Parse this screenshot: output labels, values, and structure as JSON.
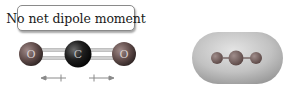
{
  "label": {
    "text": "No net dipole moment"
  },
  "molecule_left": {
    "name": "CO2 ball-and-stick",
    "atoms": [
      {
        "symbol": "O",
        "cx": 31,
        "cy": 54,
        "r": 12,
        "color": "#6e5a58"
      },
      {
        "symbol": "C",
        "cx": 78,
        "cy": 54,
        "r": 13,
        "color": "#1a1a1a"
      },
      {
        "symbol": "O",
        "cx": 124,
        "cy": 54,
        "r": 12,
        "color": "#6e5a58"
      }
    ],
    "bond_color": "#c8c8c8",
    "dipole_arrows": [
      {
        "direction": "left",
        "x1": 65,
        "x2": 42,
        "y": 78
      },
      {
        "direction": "right",
        "x1": 90,
        "x2": 113,
        "y": 78
      }
    ]
  },
  "molecule_right": {
    "name": "CO2 electron density cloud",
    "cloud_color": "#c4c4c4",
    "atoms": [
      {
        "cx": 217,
        "cy": 58,
        "r": 6,
        "color": "#7a6563"
      },
      {
        "cx": 236,
        "cy": 58,
        "r": 7,
        "color": "#7d6a68"
      },
      {
        "cx": 256,
        "cy": 58,
        "r": 6,
        "color": "#7a6563"
      }
    ]
  }
}
